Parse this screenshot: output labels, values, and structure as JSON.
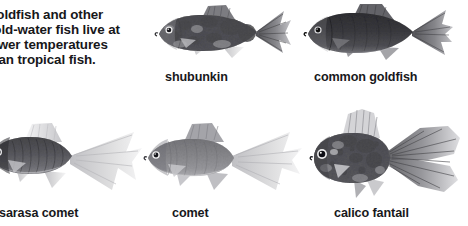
{
  "figure": {
    "background_color": "#ffffff",
    "text_color": "#18181b",
    "caption": {
      "clipped_at_left_edge": true,
      "full_text": "Goldfish and other cold-water fish live at lower temperatures than tropical fish.",
      "lines": [
        "Goldfish and other",
        "cold-water fish live at",
        "lower temperatures",
        "than tropical fish."
      ]
    },
    "rows": [
      {
        "row": "top",
        "specimens": [
          {
            "label": "shubunkin",
            "pattern": "mottled calico with dark blotches",
            "tone": "#5e5e60",
            "facing": "left"
          },
          {
            "label": "common goldfish",
            "pattern": "uniform solid dark body",
            "tone": "#2d2d30",
            "facing": "left"
          }
        ]
      },
      {
        "row": "bottom",
        "specimens": [
          {
            "label": "sarasa comet",
            "pattern": "dark head and body with pale translucent long forked tail",
            "tone": "#4a4a4c",
            "facing": "left",
            "clipped_at_left_edge": true
          },
          {
            "label": "comet",
            "pattern": "slender uniform mid-grey body, long deeply forked tail",
            "tone": "#7a7a7c",
            "facing": "left"
          },
          {
            "label": "calico fantail",
            "pattern": "round speckled body with large feathery fantail fins",
            "tone": "#56565a",
            "facing": "left"
          }
        ]
      }
    ]
  }
}
